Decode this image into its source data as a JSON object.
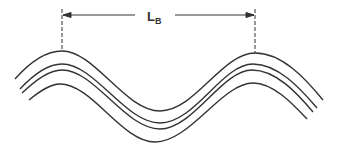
{
  "diagram": {
    "dimension": {
      "label_main": "L",
      "label_sub": "B",
      "description": "Bend wavelength dimension spanning crest to crest"
    },
    "curve_count": 4,
    "colors": {
      "line": "#333333",
      "background": "#ffffff"
    }
  }
}
